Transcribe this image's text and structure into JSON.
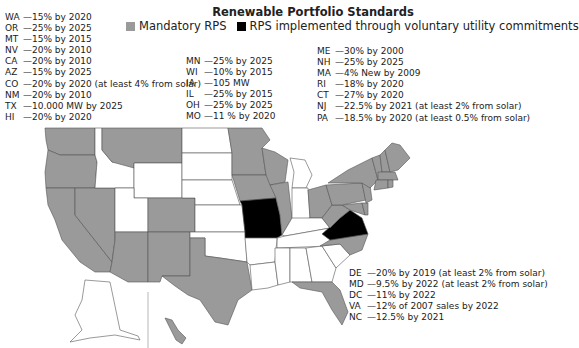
{
  "title": "Renewable Portfolio Standards",
  "legend": [
    {
      "label": "Mandatory RPS",
      "color": "#9a9a9a"
    },
    {
      "label": "RPS implemented through voluntary utility commitments",
      "color": "#000000"
    }
  ],
  "colors": {
    "mandatory": "#9a9a9a",
    "voluntary": "#000000",
    "none": "#ffffff",
    "border": "#555555"
  },
  "notes_west": [
    {
      "state": "WA",
      "text": "—15% by 2020"
    },
    {
      "state": "OR",
      "text": "—25% by 2025"
    },
    {
      "state": "MT",
      "text": "—15% by 2015"
    },
    {
      "state": "NV",
      "text": "—20% by 2010"
    },
    {
      "state": "CA",
      "text": "—20% by 2010"
    },
    {
      "state": "AZ",
      "text": "—15% by 2025"
    },
    {
      "state": "CO",
      "text": "—20% by 2020 (at least 4% from solar)"
    },
    {
      "state": "NM",
      "text": "—20% by 2010"
    },
    {
      "state": "TX",
      "text": "—10.000 MW by 2025"
    },
    {
      "state": "HI",
      "text": "—20% by 2020"
    }
  ],
  "notes_central": [
    {
      "state": "MN",
      "text": "—25% by 2025"
    },
    {
      "state": "WI",
      "text": "—10% by 2015"
    },
    {
      "state": "IA",
      "text": "—105 MW"
    },
    {
      "state": "IL",
      "text": "—25% by 2015"
    },
    {
      "state": "OH",
      "text": "—25% by 2025"
    },
    {
      "state": "MO",
      "text": "—11 % by 2020"
    }
  ],
  "notes_northeast": [
    {
      "state": "ME",
      "text": "—30% by 2000"
    },
    {
      "state": "NH",
      "text": "—25% by 2025"
    },
    {
      "state": "MA",
      "text": "—4% New by 2009"
    },
    {
      "state": "RI",
      "text": "—18% by 2020"
    },
    {
      "state": "CT",
      "text": "—27% by 2020"
    },
    {
      "state": "NJ",
      "text": "—22.5% by 2021 (at least 2% from solar)"
    },
    {
      "state": "PA",
      "text": "—18.5% by 2020 (at least 0.5% from solar)"
    }
  ],
  "notes_southeast": [
    {
      "state": "DE",
      "text": "—20% by 2019 (at least 2% from solar)"
    },
    {
      "state": "MD",
      "text": "—9.5% by 2022 (at least 2% from solar)"
    },
    {
      "state": "DC",
      "text": "—11% by 2022"
    },
    {
      "state": "VA",
      "text": "—12% of 2007 sales by 2022"
    },
    {
      "state": "NC",
      "text": "—12.5% by 2021"
    }
  ]
}
